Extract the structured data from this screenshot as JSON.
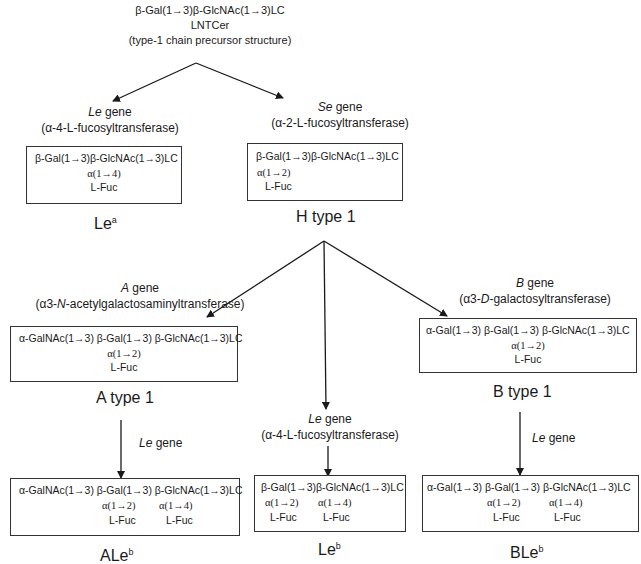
{
  "precursor": {
    "line1": "β-Gal(1→3)β-GlcNAc(1→3)LC",
    "line2": "LNTCer",
    "line3": "(type-1 chain precursor structure)"
  },
  "le_gene_top": {
    "gene": "Le",
    "gene_suffix": " gene",
    "enzyme": "(α-4-L-fucosyltransferase)"
  },
  "se_gene": {
    "gene": "Se",
    "gene_suffix": " gene",
    "enzyme": "(α-2-L-fucosyltransferase)"
  },
  "lea": {
    "box": {
      "line1": "β-Gal(1→3)β-GlcNAc(1→3)LC",
      "line2": "α(1→4)",
      "line3": "L-Fuc"
    },
    "label": "Le",
    "label_sup": "a"
  },
  "h_type1": {
    "box": {
      "line1": "β-Gal(1→3)β-GlcNAc(1→3)LC",
      "line2": "α(1→2)",
      "line3": "L-Fuc"
    },
    "label": "H type 1"
  },
  "a_gene": {
    "gene": "A",
    "gene_suffix": " gene",
    "enzyme_pre": "(α3-",
    "enzyme_italic": "N",
    "enzyme_post": "-acetylgalactosaminyltransferase)"
  },
  "b_gene": {
    "gene": "B",
    "gene_suffix": " gene",
    "enzyme_pre": "(α3-",
    "enzyme_italic": "D",
    "enzyme_post": "-galactosyltransferase)"
  },
  "le_gene_middle": {
    "gene": "Le",
    "gene_suffix": " gene",
    "enzyme": "(α-4-L-fucosyltransferase)"
  },
  "a_type1": {
    "box": {
      "line1": "α-GalNAc(1→3) β-Gal(1→3) β-GlcNAc(1→3)LC",
      "line2": "α(1→2)",
      "line3": "L-Fuc"
    },
    "label": "A type 1"
  },
  "b_type1": {
    "box": {
      "line1": "α-Gal(1→3) β-Gal(1→3) β-GlcNAc(1→3)LC",
      "line2": "α(1→2)",
      "line3": "L-Fuc"
    },
    "label": "B type 1"
  },
  "le_gene_left": {
    "gene": "Le",
    "gene_suffix": " gene"
  },
  "le_gene_right": {
    "gene": "Le",
    "gene_suffix": " gene"
  },
  "aleb": {
    "box": {
      "line1": "α-GalNAc(1→3) β-Gal(1→3) β-GlcNAc(1→3)LC",
      "link_a": "α(1→2)",
      "fuc_a": "L-Fuc",
      "link_b": "α(1→4)",
      "fuc_b": "L-Fuc"
    },
    "label": "ALe",
    "label_sup": "b"
  },
  "leb": {
    "box": {
      "line1": "β-Gal(1→3)β-GlcNAc(1→3)LC",
      "link_a": "α(1→2)",
      "fuc_a": "L-Fuc",
      "link_b": "α(1→4)",
      "fuc_b": "L-Fuc"
    },
    "label": "Le",
    "label_sup": "b"
  },
  "bleb": {
    "box": {
      "line1": "α-Gal(1→3) β-Gal(1→3) β-GlcNAc(1→3)LC",
      "link_a": "α(1→2)",
      "fuc_a": "L-Fuc",
      "link_b": "α(1→4)",
      "fuc_b": "L-Fuc"
    },
    "label": "BLe",
    "label_sup": "b"
  }
}
